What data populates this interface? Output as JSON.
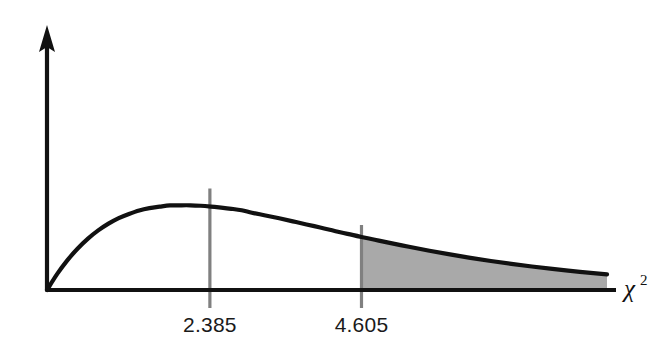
{
  "figure": {
    "title": "",
    "background_color": "#ffffff",
    "width": 665,
    "height": 351
  },
  "axes": {
    "x_axis_label": "χ",
    "x_axis_label_superscript": "2",
    "x_axis_label_full": "χ²",
    "y_axis_label": "",
    "axis_color": "#111111",
    "x_axis_has_arrow": false,
    "y_axis_has_arrow": true
  },
  "markers": [
    {
      "name": "critical-value-test-statistic",
      "label": "2.385",
      "x_value": 2.385,
      "line_color": "#808080"
    },
    {
      "name": "critical-value-alpha",
      "label": "4.605",
      "x_value": 4.605,
      "line_color": "#808080"
    }
  ],
  "shaded_region": {
    "name": "rejection-region",
    "label": "",
    "from_x": 4.605,
    "to_x": 8.2,
    "fill_color": "#a9a9a9"
  },
  "chart_data": {
    "type": "line",
    "title": "",
    "subtitle": "",
    "xlabel": "χ²",
    "ylabel": "",
    "grid": false,
    "legend_position": "none",
    "xlim": [
      0,
      8.2
    ],
    "ylim": [
      0,
      0.21
    ],
    "distribution": "chi-square",
    "degrees_of_freedom": 4,
    "annotations": [
      "2.385",
      "4.605",
      "χ²"
    ],
    "series": [
      {
        "name": "chi-square density (df = 4)",
        "color": "#111111",
        "x": [
          0.0,
          0.15,
          0.3,
          0.45,
          0.6,
          0.75,
          0.9,
          1.05,
          1.2,
          1.35,
          1.5,
          1.65,
          1.8,
          1.95,
          2.1,
          2.25,
          2.4,
          2.55,
          2.7,
          2.85,
          3.0,
          3.2,
          3.4,
          3.6,
          3.8,
          4.0,
          4.2,
          4.4,
          4.605,
          4.8,
          5.0,
          5.3,
          5.6,
          5.9,
          6.2,
          6.5,
          6.8,
          7.1,
          7.4,
          7.7,
          8.0,
          8.2
        ],
        "y": [
          0.0,
          0.0174,
          0.0323,
          0.0449,
          0.0556,
          0.0645,
          0.0718,
          0.0778,
          0.0823,
          0.0861,
          0.0886,
          0.0902,
          0.0915,
          0.0917,
          0.0917,
          0.0912,
          0.0903,
          0.0892,
          0.0879,
          0.0863,
          0.0837,
          0.0807,
          0.0776,
          0.0743,
          0.0709,
          0.0677,
          0.0642,
          0.0607,
          0.0574,
          0.0544,
          0.0513,
          0.0468,
          0.0425,
          0.0385,
          0.0348,
          0.0314,
          0.0283,
          0.0254,
          0.0228,
          0.0204,
          0.0183,
          0.017
        ]
      }
    ]
  }
}
